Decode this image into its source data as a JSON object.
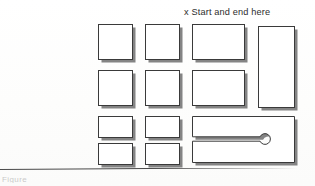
{
  "page": {
    "background_color": "#fefefe",
    "ink_color": "#3a3a3a",
    "shadow_color": "#6e6e6e"
  },
  "annotation": {
    "start_label": "x Start and end here"
  },
  "footer": {
    "cropped_text": "Figure"
  },
  "divider": {
    "present": true
  },
  "shapes": [
    {
      "id": "r1c1",
      "name": "square-r1c1",
      "kind": "rect",
      "x": 98,
      "y": 24,
      "w": 35,
      "h": 36
    },
    {
      "id": "r1c2",
      "name": "square-r1c2",
      "kind": "rect",
      "x": 145,
      "y": 24,
      "w": 35,
      "h": 36
    },
    {
      "id": "r1c3",
      "name": "wide-rect-r1c3",
      "kind": "rect",
      "x": 192,
      "y": 24,
      "w": 53,
      "h": 36
    },
    {
      "id": "r1c4",
      "name": "tall-rect-r1c4",
      "kind": "rect",
      "x": 258,
      "y": 26,
      "w": 37,
      "h": 82
    },
    {
      "id": "r2c1",
      "name": "square-r2c1",
      "kind": "rect",
      "x": 98,
      "y": 70,
      "w": 35,
      "h": 36
    },
    {
      "id": "r2c2",
      "name": "square-r2c2",
      "kind": "rect",
      "x": 145,
      "y": 70,
      "w": 35,
      "h": 36
    },
    {
      "id": "r2c3",
      "name": "wide-rect-r2c3",
      "kind": "rect",
      "x": 192,
      "y": 70,
      "w": 53,
      "h": 36
    },
    {
      "id": "r3c1",
      "name": "small-rect-r3c1",
      "kind": "rect",
      "x": 98,
      "y": 116,
      "w": 35,
      "h": 22
    },
    {
      "id": "r3c2",
      "name": "small-rect-r3c2",
      "kind": "rect",
      "x": 145,
      "y": 116,
      "w": 35,
      "h": 22
    },
    {
      "id": "r4c1",
      "name": "small-rect-r4c1",
      "kind": "rect",
      "x": 98,
      "y": 143,
      "w": 35,
      "h": 22
    },
    {
      "id": "r4c2",
      "name": "small-rect-r4c2",
      "kind": "rect",
      "x": 145,
      "y": 143,
      "w": 35,
      "h": 22
    },
    {
      "id": "slotted",
      "name": "slotted-plate",
      "kind": "slotted-rect",
      "x": 192,
      "y": 116,
      "w": 103,
      "h": 47,
      "slot": {
        "entry_y": 23,
        "half_width": 2.2,
        "hole_cx": 73,
        "hole_cy": 23,
        "hole_r": 5.4
      }
    }
  ]
}
